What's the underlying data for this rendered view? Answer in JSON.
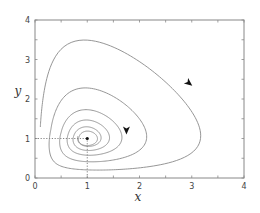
{
  "chart_data": {
    "type": "line",
    "title": "",
    "xlabel": "x",
    "ylabel": "y",
    "xlim": [
      0,
      4
    ],
    "ylim": [
      0,
      4
    ],
    "xticks": [
      0,
      1,
      2,
      3,
      4
    ],
    "yticks": [
      0,
      1,
      2,
      3,
      4
    ],
    "minor_ticks_per_major": 2,
    "grid": false,
    "legend": null,
    "equilibrium_point": {
      "x": 1,
      "y": 1
    },
    "equilibrium_guides": "dotted lines from (1,1) to each axis",
    "series": [
      {
        "name": "spiral trajectory (clockwise, converging to equilibrium)",
        "description": "damped predator-prey phase portrait",
        "loops": [
          {
            "x_min": 0.12,
            "x_max": 3.74,
            "y_min": 0.12,
            "y_max": 3.7
          },
          {
            "x_min": 0.29,
            "x_max": 2.39,
            "y_min": 0.28,
            "y_max": 2.38
          },
          {
            "x_min": 0.45,
            "x_max": 1.78,
            "y_min": 0.45,
            "y_max": 1.77
          },
          {
            "x_min": 0.6,
            "x_max": 1.5,
            "y_min": 0.6,
            "y_max": 1.48
          },
          {
            "x_min": 0.72,
            "x_max": 1.32,
            "y_min": 0.72,
            "y_max": 1.3
          },
          {
            "x_min": 0.83,
            "x_max": 1.18,
            "y_min": 0.83,
            "y_max": 1.17
          }
        ],
        "arrows": [
          {
            "x": 2.95,
            "y": 2.4,
            "direction": "down-right"
          },
          {
            "x": 1.75,
            "y": 1.2,
            "direction": "down"
          }
        ]
      }
    ]
  },
  "axes": {
    "x_tick_labels": [
      "0",
      "1",
      "2",
      "3",
      "4"
    ],
    "y_tick_labels": [
      "0",
      "1",
      "2",
      "3",
      "4"
    ],
    "x_label": "x",
    "y_label": "y"
  }
}
